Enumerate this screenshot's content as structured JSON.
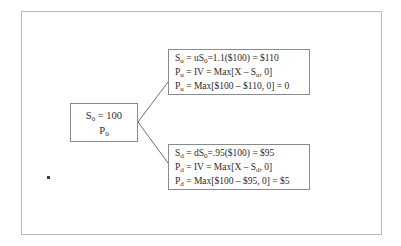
{
  "diagram": {
    "root_node": {
      "name": "root-node",
      "lines": [
        "S₀ = 100",
        "P₀"
      ],
      "line1_symbol": "S",
      "line1_sub": "0",
      "line1_rest": " = 100",
      "line2_symbol": "P",
      "line2_sub": "0",
      "line2_rest": ""
    },
    "up_node": {
      "name": "up-state-node",
      "lines": [
        "Sᵤ = uS₀ =1.1($100) = $110",
        "Pᵤ = IV = Max[X − Sᵤ, 0]",
        "Pᵤ = Max[$100 − $110, 0] = 0"
      ],
      "line1_a": "S",
      "line1_a_sub": "u",
      "line1_b": " = uS",
      "line1_b_sub": "0",
      "line1_c": "=1.1($100) = $110",
      "line2_a": "P",
      "line2_a_sub": "u",
      "line2_b": " = IV = Max[X – S",
      "line2_b_sub": "u",
      "line2_c": ", 0]",
      "line3_a": "P",
      "line3_a_sub": "u",
      "line3_b": " = Max[$100 – $110, 0] = 0"
    },
    "down_node": {
      "name": "down-state-node",
      "lines": [
        "Sₔ = dS₀ =.95($100) = $95",
        "Pₔ = IV = Max[X − Sₔ, 0]",
        "Pₔ = Max[$100 − $95, 0] = $5"
      ],
      "line1_a": "S",
      "line1_a_sub": "d",
      "line1_b": " = dS",
      "line1_b_sub": "0",
      "line1_c": "=.95($100) = $95",
      "line2_a": "P",
      "line2_a_sub": "d",
      "line2_b": " = IV = Max[X – S",
      "line2_b_sub": "d",
      "line2_c": ", 0]",
      "line3_a": "P",
      "line3_a_sub": "d",
      "line3_b": " = Max[$100 – $95, 0] = $5"
    },
    "branches": {
      "up_branch_name": "up-branch-line",
      "down_branch_name": "down-branch-line"
    },
    "colors": {
      "box_border": "#8a8a8a",
      "frame_border": "#b9b9b9",
      "text": "#2b2b2b",
      "background": "#ffffff"
    }
  }
}
